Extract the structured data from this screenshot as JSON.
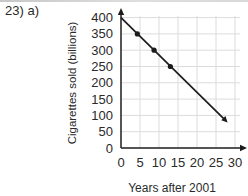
{
  "page": {
    "problem_label": "23) a)"
  },
  "chart_data": {
    "type": "line",
    "title": "",
    "xlabel": "Years after 2001",
    "ylabel": "Cigarettes sold (billions)",
    "xlim": [
      0,
      32
    ],
    "ylim": [
      0,
      415
    ],
    "xticks": [
      0,
      5,
      10,
      15,
      20,
      25,
      30
    ],
    "yticks": [
      0,
      50,
      100,
      150,
      200,
      250,
      300,
      350,
      400
    ],
    "grid": true,
    "legend": false,
    "trend_line": {
      "x1": 0,
      "y1": 400,
      "x2": 27.5,
      "y2": 85,
      "end_arrow": true
    },
    "marked_points": [
      {
        "x": 4.3,
        "y": 350
      },
      {
        "x": 8.7,
        "y": 300
      },
      {
        "x": 13.0,
        "y": 250
      }
    ],
    "colors": {
      "line": "#1c1c1c",
      "axis": "#1c1c1c",
      "grid": "#dcdcdc",
      "text": "#2a2a2a"
    }
  }
}
